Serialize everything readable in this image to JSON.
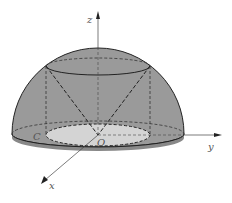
{
  "figure": {
    "labels": {
      "z_axis": "z",
      "y_axis": "y",
      "x_axis": "x",
      "origin": "O",
      "point_c": "C"
    },
    "colors": {
      "hemisphere_fill": "#9a9a9a",
      "base_fill": "#8c8c8c",
      "inner_disk_fill": "#d4d4d4",
      "stroke": "#222222",
      "axis": "#444444"
    }
  }
}
